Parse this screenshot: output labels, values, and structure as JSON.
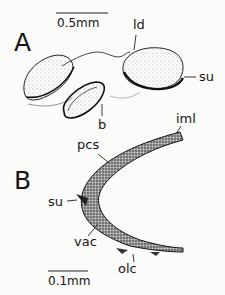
{
  "figure": {
    "panels": [
      {
        "id": "A",
        "label": "A",
        "scale_bar": "0.5mm",
        "labels": {
          "ld": "ld",
          "su": "su",
          "b": "b"
        }
      },
      {
        "id": "B",
        "label": "B",
        "scale_bar": "0.1mm",
        "labels": {
          "iml": "iml",
          "pcs": "pcs",
          "su": "su",
          "vac": "vac",
          "olc": "olc"
        }
      }
    ]
  }
}
